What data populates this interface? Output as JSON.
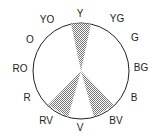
{
  "diagram": {
    "type": "color-wheel",
    "scheme": "split-complementary",
    "highlighted": [
      "Y",
      "RV",
      "BV"
    ],
    "colors": {
      "stroke": "#222222",
      "hatch": "#777777",
      "background": "#ffffff"
    },
    "labels": {
      "Y": "Y",
      "YG": "YG",
      "G": "G",
      "BG": "BG",
      "B": "B",
      "BV": "BV",
      "V": "V",
      "RV": "RV",
      "R": "R",
      "RO": "RO",
      "O": "O",
      "YO": "YO"
    }
  }
}
